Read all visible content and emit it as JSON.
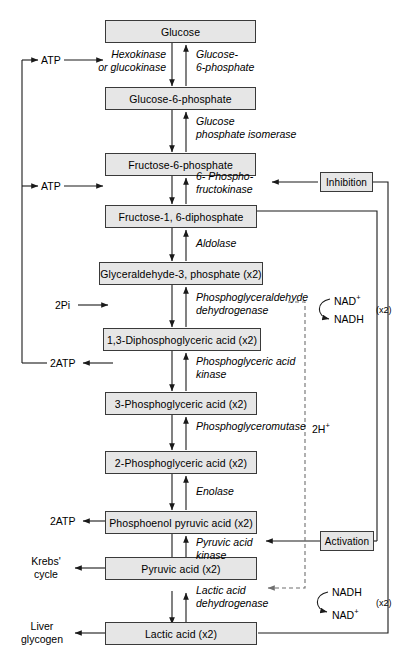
{
  "diagram": {
    "colors": {
      "box_fill": "#e6e6e6",
      "box_stroke": "#3a3a3a",
      "line": "#1a1a1a",
      "dashed": "#7a7a7a"
    },
    "metabolites": [
      {
        "id": "glucose",
        "label": "Glucose"
      },
      {
        "id": "g6p",
        "label": "Glucose-6-phosphate"
      },
      {
        "id": "f6p",
        "label": "Fructose-6-phosphate"
      },
      {
        "id": "fdp",
        "label": "Fructose-1, 6-diphosphate"
      },
      {
        "id": "g3p",
        "label": "Glyceraldehyde-3, phosphate (x2)"
      },
      {
        "id": "dpg",
        "label": "1,3-Diphosphoglyceric acid (x2)"
      },
      {
        "id": "pg3",
        "label": "3-Phosphoglyceric acid (x2)"
      },
      {
        "id": "pg2",
        "label": "2-Phosphoglyceric acid (x2)"
      },
      {
        "id": "pep",
        "label": "Phosphoenol pyruvic acid (x2)"
      },
      {
        "id": "pyruvate",
        "label": "Pyruvic acid (x2)"
      },
      {
        "id": "lactate",
        "label": "Lactic acid (x2)"
      }
    ],
    "enzymes": [
      {
        "id": "hexokinase",
        "line1": "Hexokinase",
        "line2": "or glucokinase"
      },
      {
        "id": "g6pase",
        "line1": "Glucose-",
        "line2": "6-phosphate"
      },
      {
        "id": "gpi",
        "line1": "Glucose",
        "line2": "phosphate isomerase"
      },
      {
        "id": "pfk",
        "line1": "6- Phospho-",
        "line2": "fructokinase"
      },
      {
        "id": "aldolase",
        "line1": "Aldolase",
        "line2": ""
      },
      {
        "id": "gapdh",
        "line1": "Phosphoglyceraldehyde",
        "line2": "dehydrogenase"
      },
      {
        "id": "pgk",
        "line1": "Phosphoglyceric acid",
        "line2": "kinase"
      },
      {
        "id": "pgm",
        "line1": "Phosphoglyceromutase",
        "line2": ""
      },
      {
        "id": "enolase",
        "line1": "Enolase",
        "line2": ""
      },
      {
        "id": "pk",
        "line1": "Pyruvic acid",
        "line2": "kinase"
      },
      {
        "id": "ldh",
        "line1": "Lactic acid",
        "line2": "dehydrogenase"
      }
    ],
    "regulators": [
      {
        "id": "inhibition",
        "label": "Inhibition"
      },
      {
        "id": "activation",
        "label": "Activation"
      }
    ],
    "side_labels": [
      {
        "id": "atp-in-1",
        "label": "ATP"
      },
      {
        "id": "atp-in-2",
        "label": "ATP"
      },
      {
        "id": "pi-in",
        "label": "2Pi"
      },
      {
        "id": "atp-out-1",
        "label": "2ATP"
      },
      {
        "id": "atp-out-2",
        "label": "2ATP"
      },
      {
        "id": "krebs",
        "line1": "Krebs'",
        "line2": "cycle"
      },
      {
        "id": "liver",
        "line1": "Liver",
        "line2": "glycogen"
      },
      {
        "id": "protons",
        "label": "2H+"
      }
    ],
    "cofactors": [
      {
        "id": "nad-pair-upper",
        "from": "NAD+",
        "to": "NADH",
        "multiplier": "(x2)"
      },
      {
        "id": "nad-pair-lower",
        "from": "NADH",
        "to": "NAD+",
        "multiplier": "(x2)"
      }
    ]
  }
}
